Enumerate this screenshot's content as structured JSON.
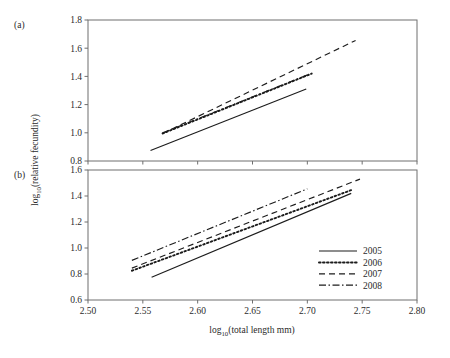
{
  "figure": {
    "panel_a_label": "(a)",
    "panel_b_label": "(b)",
    "ylabel": "log",
    "ylabel_sub": "10",
    "ylabel_rest": "(relative fecundity)",
    "xlabel": "log",
    "xlabel_sub": "10",
    "xlabel_rest": "(total length mm)"
  },
  "legend": {
    "position": "bottom-right-panel-b",
    "items": [
      {
        "label": "2005",
        "style": "solid",
        "color": "#1c1c1c",
        "dash": ""
      },
      {
        "label": "2006",
        "style": "dotted",
        "color": "#1c1c1c",
        "dash": "1.6 2.4"
      },
      {
        "label": "2007",
        "style": "dashed",
        "color": "#1c1c1c",
        "dash": "6 4"
      },
      {
        "label": "2008",
        "style": "dash-dot",
        "color": "#1c1c1c",
        "dash": "7 2.5 1.5 2.5"
      }
    ]
  },
  "chart_data": [
    {
      "type": "line",
      "panel": "(a)",
      "title": "",
      "xlabel": "log10(total length mm)",
      "ylabel": "log10(relative fecundity)",
      "xlim": [
        2.5,
        2.8
      ],
      "ylim": [
        0.8,
        1.8
      ],
      "xticks": [
        "2.50",
        "2.55",
        "2.60",
        "2.65",
        "2.70",
        "2.75",
        "2.80"
      ],
      "xtick_values": [
        2.5,
        2.55,
        2.6,
        2.65,
        2.7,
        2.75,
        2.8
      ],
      "yticks": [
        "0.8",
        "1.0",
        "1.2",
        "1.4",
        "1.6",
        "1.8"
      ],
      "ytick_values": [
        0.8,
        1.0,
        1.2,
        1.4,
        1.6,
        1.8
      ],
      "grid": false,
      "legend_position": "none",
      "series": [
        {
          "name": "2005",
          "style": "solid",
          "x": [
            2.557,
            2.699
          ],
          "y": [
            0.875,
            1.31
          ]
        },
        {
          "name": "2006",
          "style": "dotted",
          "x": [
            2.568,
            2.704
          ],
          "y": [
            0.995,
            1.42
          ]
        },
        {
          "name": "2007",
          "style": "dashed",
          "x": [
            2.568,
            2.744
          ],
          "y": [
            0.995,
            1.655
          ]
        },
        {
          "name": "2008",
          "style": "dash-dot",
          "x": [
            2.568,
            2.7
          ],
          "y": [
            1.0,
            1.41
          ]
        }
      ]
    },
    {
      "type": "line",
      "panel": "(b)",
      "title": "",
      "xlabel": "log10(total length mm)",
      "ylabel": "log10(relative fecundity)",
      "xlim": [
        2.5,
        2.8
      ],
      "ylim": [
        0.6,
        1.6
      ],
      "xticks": [
        "2.50",
        "2.55",
        "2.60",
        "2.65",
        "2.70",
        "2.75",
        "2.80"
      ],
      "xtick_values": [
        2.5,
        2.55,
        2.6,
        2.65,
        2.7,
        2.75,
        2.8
      ],
      "yticks": [
        "0.6",
        "0.8",
        "1.0",
        "1.2",
        "1.4",
        "1.6"
      ],
      "ytick_values": [
        0.6,
        0.8,
        1.0,
        1.2,
        1.4,
        1.6
      ],
      "grid": false,
      "legend_position": "lower right",
      "series": [
        {
          "name": "2005",
          "style": "solid",
          "x": [
            2.558,
            2.74
          ],
          "y": [
            0.775,
            1.42
          ]
        },
        {
          "name": "2006",
          "style": "dotted",
          "x": [
            2.54,
            2.74
          ],
          "y": [
            0.825,
            1.445
          ]
        },
        {
          "name": "2007",
          "style": "dashed",
          "x": [
            2.54,
            2.748
          ],
          "y": [
            0.845,
            1.53
          ]
        },
        {
          "name": "2008",
          "style": "dash-dot",
          "x": [
            2.54,
            2.7
          ],
          "y": [
            0.905,
            1.455
          ]
        }
      ]
    }
  ]
}
